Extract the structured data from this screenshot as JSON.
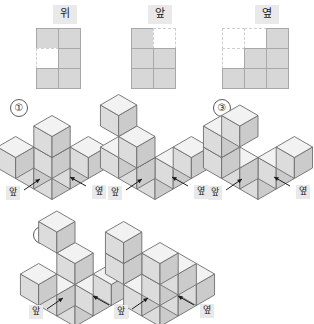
{
  "projections": {
    "items": [
      {
        "label": "위",
        "name": "top-view",
        "cols": 2,
        "rows": 3,
        "cells": [
          1,
          1,
          0,
          1,
          1,
          1
        ]
      },
      {
        "label": "앞",
        "name": "front-view",
        "cols": 2,
        "rows": 3,
        "cells": [
          1,
          0,
          1,
          1,
          1,
          1
        ]
      },
      {
        "label": "옆",
        "name": "side-view",
        "cols": 3,
        "rows": 3,
        "cells": [
          0,
          0,
          1,
          0,
          1,
          1,
          1,
          1,
          1
        ]
      }
    ]
  },
  "options": [
    {
      "number": "①",
      "name": "option-1",
      "cubes": [
        {
          "x": 0,
          "y": 0,
          "z": 0
        },
        {
          "x": 1,
          "y": 0,
          "z": 0
        },
        {
          "x": 2,
          "y": 0,
          "z": 0
        },
        {
          "x": 0,
          "y": 1,
          "z": 0
        },
        {
          "x": 0,
          "y": 2,
          "z": 0
        },
        {
          "x": 0,
          "y": 0,
          "z": 1
        },
        {
          "x": 0,
          "y": 0,
          "z": 2
        }
      ],
      "front_label": "앞",
      "side_label": "옆"
    },
    {
      "number": "②",
      "name": "option-2",
      "cubes": [
        {
          "x": 0,
          "y": 0,
          "z": 0
        },
        {
          "x": 1,
          "y": 0,
          "z": 0
        },
        {
          "x": 2,
          "y": 0,
          "z": 0
        },
        {
          "x": 0,
          "y": 1,
          "z": 0
        },
        {
          "x": 0,
          "y": 2,
          "z": 0
        },
        {
          "x": 0,
          "y": 1,
          "z": 1
        },
        {
          "x": 0,
          "y": 2,
          "z": 2
        }
      ],
      "front_label": "앞",
      "side_label": "옆"
    },
    {
      "number": "③",
      "name": "option-3",
      "cubes": [
        {
          "x": 0,
          "y": 0,
          "z": 0
        },
        {
          "x": 1,
          "y": 0,
          "z": 0
        },
        {
          "x": 2,
          "y": 0,
          "z": 0
        },
        {
          "x": 0,
          "y": 1,
          "z": 0
        },
        {
          "x": 0,
          "y": 2,
          "z": 0
        },
        {
          "x": 0,
          "y": 2,
          "z": 1
        },
        {
          "x": 1,
          "y": 2,
          "z": 1
        }
      ],
      "front_label": "앞",
      "side_label": "옆"
    },
    {
      "number": "④",
      "name": "option-4",
      "cubes": [
        {
          "x": 0,
          "y": 0,
          "z": 0
        },
        {
          "x": 1,
          "y": 0,
          "z": 0
        },
        {
          "x": 2,
          "y": 0,
          "z": 0
        },
        {
          "x": 0,
          "y": 1,
          "z": 0
        },
        {
          "x": 0,
          "y": 2,
          "z": 0
        },
        {
          "x": 1,
          "y": 1,
          "z": 1
        },
        {
          "x": 1,
          "y": 2,
          "z": 2
        }
      ],
      "front_label": "앞",
      "side_label": "옆"
    },
    {
      "number": "⑤",
      "name": "option-5",
      "cubes": [
        {
          "x": 0,
          "y": 0,
          "z": 0
        },
        {
          "x": 1,
          "y": 0,
          "z": 0
        },
        {
          "x": 2,
          "y": 0,
          "z": 0
        },
        {
          "x": 0,
          "y": 1,
          "z": 0
        },
        {
          "x": 1,
          "y": 1,
          "z": 0
        },
        {
          "x": 2,
          "y": 1,
          "z": 0
        },
        {
          "x": 1,
          "y": 1,
          "z": 1
        },
        {
          "x": 0,
          "y": 2,
          "z": 1
        },
        {
          "x": 0,
          "y": 2,
          "z": 2
        }
      ],
      "front_label": "앞",
      "side_label": "옆"
    }
  ],
  "colors": {
    "cube_top": "#f2f2f2",
    "cube_left": "#dcdcdc",
    "cube_right": "#cbcbcb",
    "cube_stroke": "#6e6e6e",
    "grid_fill": "#d7d7d7",
    "grid_stroke": "#a8a8a8",
    "label_bg": "#e9e9e9",
    "background": "#ffffff"
  }
}
